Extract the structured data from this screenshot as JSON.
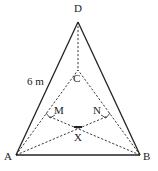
{
  "diagram": {
    "type": "tetrahedron-net-sketch",
    "points": {
      "D": {
        "label": "D",
        "x": 78,
        "y": 22
      },
      "C": {
        "label": "C",
        "x": 78,
        "y": 70
      },
      "A": {
        "label": "A",
        "x": 16,
        "y": 155
      },
      "B": {
        "label": "B",
        "x": 140,
        "y": 155
      },
      "M": {
        "label": "M",
        "x": 48,
        "y": 114
      },
      "N": {
        "label": "N",
        "x": 108,
        "y": 114
      },
      "X": {
        "label": "X",
        "x": 78,
        "y": 127
      }
    },
    "edge_labels": {
      "AD": "6 m"
    },
    "solid_edges": [
      "AD",
      "BD",
      "AB"
    ],
    "dashed_edges": [
      "DC",
      "AC",
      "BC",
      "AX",
      "BX",
      "AN",
      "BM"
    ],
    "right_angle_marks": [
      "M",
      "N"
    ]
  }
}
